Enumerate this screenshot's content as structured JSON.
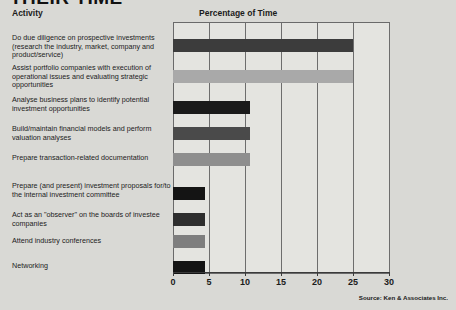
{
  "headline": "THEIR TIME",
  "columns": {
    "activity": "Activity",
    "percentage": "Percentage of Time"
  },
  "source": "Source: Ken & Associates Inc.",
  "chart_data": {
    "type": "bar",
    "orientation": "horizontal",
    "title": "THEIR TIME",
    "xlabel": "Percentage of Time",
    "ylabel": "Activity",
    "xlim": [
      0,
      30
    ],
    "xticks": [
      0,
      5,
      10,
      15,
      20,
      25,
      30
    ],
    "grid": true,
    "legend": "none",
    "categories": [
      "Do due diligence on prospective investments (research the industry, market, company and product/service)",
      "Assist portfolio companies with execution of operational issues and evaluating strategic opportunities",
      "Analyse business plans to identify potential investment opportunities",
      "Build/maintain financial models and perform valuation analyses",
      "Prepare transaction-related documentation",
      "Prepare (and present) investment proposals for/to the internal investment committee",
      "Act as an \"observer\" on the boards of investee companies",
      "Attend industry conferences",
      "Networking"
    ],
    "values": [
      25,
      25,
      10.7,
      10.7,
      10.7,
      4.5,
      4.5,
      4.5,
      4.5
    ],
    "bar_colors": [
      "#3c3c3c",
      "#a9a9a9",
      "#1a1a1a",
      "#4a4a4a",
      "#8e8e8e",
      "#141414",
      "#2e2e2e",
      "#7e7e7e",
      "#141414"
    ]
  }
}
